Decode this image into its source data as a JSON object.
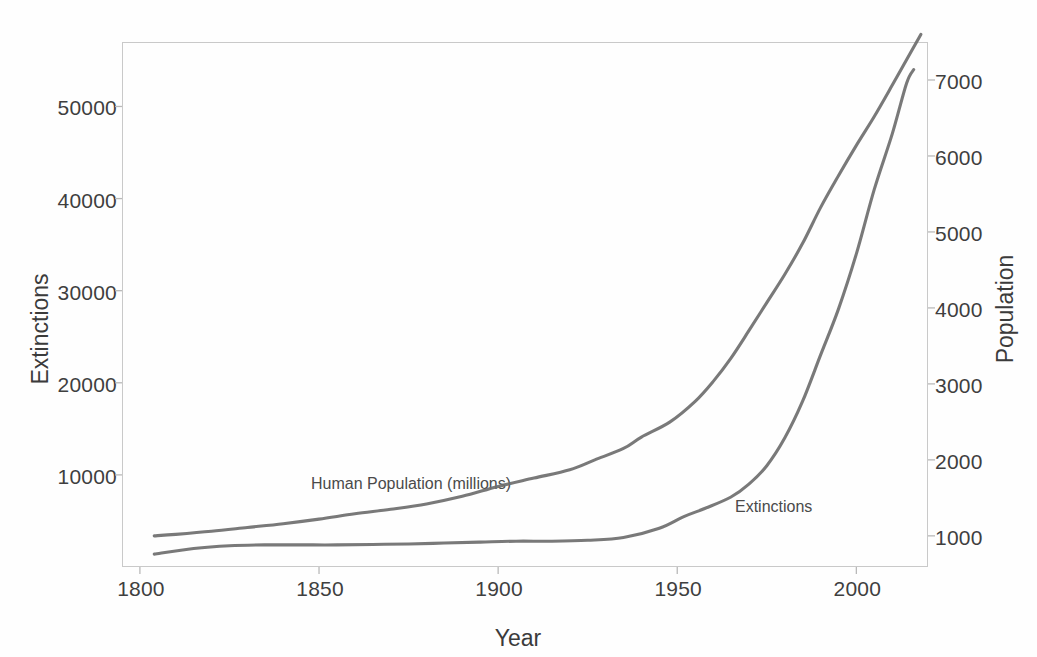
{
  "chart_data": {
    "type": "line",
    "title": "",
    "xlabel": "Year",
    "ylabel": "Extinctions",
    "y2label": "Population",
    "xlim": [
      1795,
      2020
    ],
    "ylim": [
      0,
      57000
    ],
    "y2lim": [
      590,
      7500
    ],
    "grid": false,
    "legend_position": "inline-annotations",
    "xticks": [
      "1800",
      "1850",
      "1900",
      "1950",
      "2000"
    ],
    "xtick_values": [
      1800,
      1850,
      1900,
      1950,
      2000
    ],
    "yticks_left": [
      "10000",
      "20000",
      "30000",
      "40000",
      "50000"
    ],
    "ytick_left_values": [
      10000,
      20000,
      30000,
      40000,
      50000
    ],
    "yticks_right": [
      "1000",
      "2000",
      "3000",
      "4000",
      "5000",
      "6000",
      "7000"
    ],
    "ytick_right_values": [
      1000,
      2000,
      3000,
      4000,
      5000,
      6000,
      7000
    ],
    "annotations": [
      {
        "text": "Human Population (millions)",
        "x": 1815,
        "y_axis": "right"
      },
      {
        "text": "Extinctions",
        "x": 1944,
        "y_axis": "left"
      }
    ],
    "series": [
      {
        "name": "Human Population (millions)",
        "axis": "right",
        "color": "#6e6e6e",
        "x": [
          1804,
          1810,
          1820,
          1830,
          1840,
          1850,
          1860,
          1870,
          1880,
          1890,
          1900,
          1910,
          1920,
          1927,
          1935,
          1940,
          1948,
          1955,
          1960,
          1965,
          1970,
          1975,
          1980,
          1985,
          1990,
          1995,
          2000,
          2005,
          2010,
          2015,
          2018
        ],
        "values": [
          1000,
          1020,
          1060,
          1110,
          1160,
          1220,
          1290,
          1350,
          1420,
          1520,
          1650,
          1760,
          1870,
          2000,
          2150,
          2300,
          2500,
          2770,
          3030,
          3340,
          3700,
          4070,
          4440,
          4850,
          5320,
          5740,
          6140,
          6520,
          6930,
          7350,
          7600
        ]
      },
      {
        "name": "Extinctions",
        "axis": "left",
        "color": "#6e6e6e",
        "x": [
          1804,
          1815,
          1825,
          1835,
          1845,
          1855,
          1865,
          1875,
          1885,
          1895,
          1905,
          1915,
          1925,
          1935,
          1945,
          1952,
          1958,
          1965,
          1970,
          1975,
          1980,
          1985,
          1990,
          1995,
          2000,
          2005,
          2010,
          2014,
          2016
        ],
        "values": [
          1400,
          2000,
          2300,
          2400,
          2400,
          2400,
          2450,
          2500,
          2600,
          2700,
          2800,
          2800,
          2900,
          3200,
          4200,
          5500,
          6400,
          7600,
          9000,
          11000,
          14000,
          18000,
          23000,
          28000,
          34000,
          41000,
          47000,
          52500,
          54000
        ]
      }
    ]
  },
  "axes": {
    "x_title": "Year",
    "y_left_title": "Extinctions",
    "y_right_title": "Population"
  }
}
